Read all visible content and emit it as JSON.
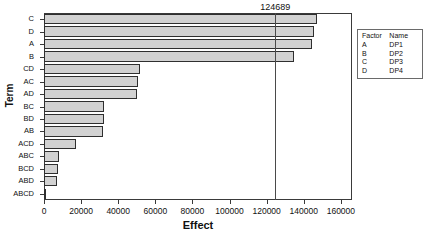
{
  "chart_data": {
    "type": "bar",
    "orientation": "horizontal",
    "title": "",
    "xlabel": "Effect",
    "ylabel": "Term",
    "categories": [
      "C",
      "D",
      "A",
      "B",
      "CD",
      "AC",
      "AD",
      "BC",
      "BD",
      "AB",
      "ACD",
      "ABC",
      "BCD",
      "ABD",
      "ABCD"
    ],
    "values": [
      147000,
      145500,
      144400,
      134700,
      51700,
      50600,
      50100,
      32300,
      32300,
      31800,
      17200,
      8100,
      7500,
      7000,
      1100
    ],
    "xlim": [
      0,
      166000
    ],
    "xticks": [
      0,
      20000,
      40000,
      60000,
      80000,
      100000,
      120000,
      140000,
      160000
    ],
    "xtick_labels": [
      "0",
      "20000",
      "40000",
      "60000",
      "80000",
      "100000",
      "120000",
      "140000",
      "160000"
    ],
    "grid": false,
    "legend_position": "right",
    "reference_line": {
      "value": 124689,
      "label": "124689"
    },
    "bar_color": "#d2d2d2",
    "bar_edge_color": "#2f2f2f"
  },
  "legend": {
    "headers": [
      "Factor",
      "Name"
    ],
    "rows": [
      {
        "factor": "A",
        "name": "DP1"
      },
      {
        "factor": "B",
        "name": "DP2"
      },
      {
        "factor": "C",
        "name": "DP3"
      },
      {
        "factor": "D",
        "name": "DP4"
      }
    ]
  }
}
